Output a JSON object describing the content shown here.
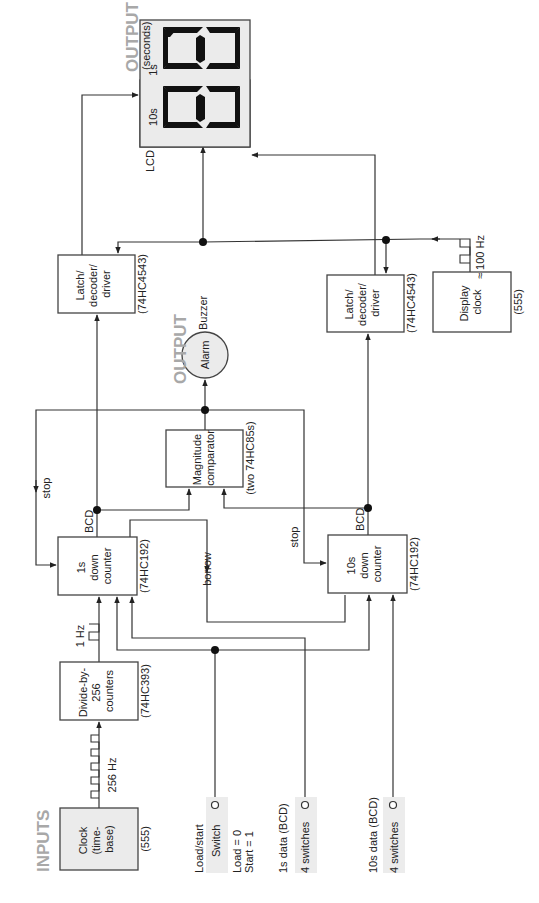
{
  "diagram": {
    "orientation": "rotated 90 degrees counter-clockwise",
    "colors": {
      "line": "#333333",
      "box_fill": "#ffffff",
      "shaded_fill": "#ebebeb",
      "section_heading": "#a8a8a8",
      "segment": "#111111"
    },
    "sections": {
      "inputs_heading": "INPUTS",
      "output_display_heading": "OUTPUT",
      "output_display_sub": "(seconds)",
      "output_alarm_heading": "OUTPUT"
    },
    "blocks": {
      "clock": {
        "lines": [
          "Clock",
          "(time-",
          "base)"
        ],
        "part": "(555)"
      },
      "divider": {
        "lines": [
          "Divide-by-",
          "256",
          "counters"
        ],
        "part": "(74HC393)"
      },
      "ones_counter": {
        "lines": [
          "1s",
          "down",
          "counter"
        ],
        "part": "(74HC192)"
      },
      "tens_counter": {
        "lines": [
          "10s",
          "down",
          "counter"
        ],
        "part": "(74HC192)"
      },
      "comparator": {
        "lines": [
          "Magnitude",
          "comparator"
        ],
        "part": "(two 74HC85s)"
      },
      "alarm": {
        "label": "Alarm",
        "tag": "Buzzer"
      },
      "latch_ones": {
        "lines": [
          "Latch/",
          "decoder/",
          "driver"
        ],
        "part": "(74HC4543)"
      },
      "latch_tens": {
        "lines": [
          "Latch/",
          "decoder/",
          "driver"
        ],
        "part": "(74HC4543)"
      },
      "display_clock": {
        "lines": [
          "Display",
          "clock"
        ],
        "part": "(555)"
      },
      "lcd": {
        "label": "LCD",
        "digit_ones": "1s",
        "digit_tens": "10s"
      }
    },
    "signals": {
      "clock_freq": "256 Hz",
      "one_hz": "1 Hz",
      "display_freq": "≈ 100 Hz",
      "bcd_ones": "BCD",
      "bcd_tens": "BCD",
      "stop_ones": "stop",
      "stop_tens": "stop",
      "borrow": "borrow"
    },
    "inputs": {
      "load_start": {
        "title": "Load/start",
        "control": "Switch",
        "note1": "Load = 0",
        "note2": "Start = 1"
      },
      "ones_data": {
        "title": "1s data (BCD)",
        "control": "4 switches"
      },
      "tens_data": {
        "title": "10s data (BCD)",
        "control": "4 switches"
      }
    }
  }
}
